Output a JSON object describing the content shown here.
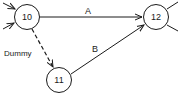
{
  "diagram": {
    "type": "activity-network",
    "nodes": [
      {
        "id": "10",
        "label": "10",
        "cx": 27,
        "cy": 17
      },
      {
        "id": "11",
        "label": "11",
        "cx": 59,
        "cy": 80
      },
      {
        "id": "12",
        "label": "12",
        "cx": 156,
        "cy": 17
      }
    ],
    "edges": [
      {
        "from": "10",
        "to": "12",
        "label": "A",
        "style": "solid"
      },
      {
        "from": "11",
        "to": "12",
        "label": "B",
        "style": "solid"
      },
      {
        "from": "10",
        "to": "11",
        "label": "Dummy",
        "style": "dashed"
      }
    ],
    "colors": {
      "stroke": "#1a1a1a",
      "background": "#ffffff"
    }
  }
}
